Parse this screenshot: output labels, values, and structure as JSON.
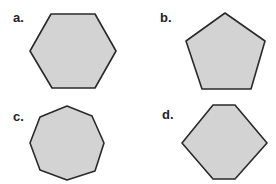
{
  "figure": {
    "fill_color": "#d3d3d3",
    "stroke_color": "#2a2a2a",
    "items": [
      {
        "label": "a.",
        "shape": "hexagon",
        "sides": 6,
        "points": "51,14 95,14 116,51 95,88 52,88 30,51"
      },
      {
        "label": "b.",
        "shape": "pentagon",
        "sides": 5,
        "points": "225,13 265,41 251,89 202,89 186,41"
      },
      {
        "label": "c.",
        "shape": "octagon",
        "sides": 8,
        "points": "67,106 92,116 104,143 95,171 67,180 40,170 30,143 40,117"
      },
      {
        "label": "d.",
        "shape": "hexagon",
        "sides": 6,
        "points": "213,105 235,105 267,143 235,179 213,179 182,143"
      }
    ]
  }
}
